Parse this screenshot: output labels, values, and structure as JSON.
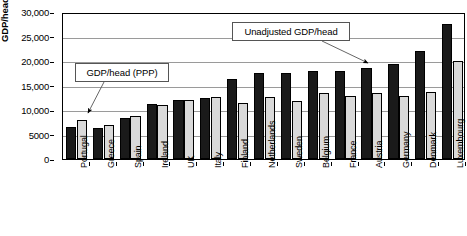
{
  "chart_data": {
    "type": "bar",
    "title": "",
    "xlabel": "",
    "ylabel": "GDP/head (£s)",
    "ylim": [
      0,
      30000
    ],
    "ytick_labels": [
      "30,000",
      "25,000",
      "20,000",
      "15,000",
      "10,000",
      "5000",
      "0"
    ],
    "ytick_values": [
      30000,
      25000,
      20000,
      15000,
      10000,
      5000,
      0
    ],
    "grid": true,
    "legend_position": "none",
    "categories": [
      "Portugal",
      "Greece",
      "Spain",
      "Ireland",
      "UK",
      "Italy",
      "Finland",
      "Netherlands",
      "Sweden",
      "Belgium",
      "France",
      "Austria",
      "Germany",
      "Denmark",
      "Luxembourg"
    ],
    "series": [
      {
        "name": "Unadjusted GDP/head",
        "color": "#1a1a1a",
        "values": [
          6500,
          6400,
          8300,
          11300,
          12000,
          12500,
          16300,
          17500,
          17600,
          17900,
          17900,
          18600,
          19300,
          22100,
          27600
        ]
      },
      {
        "name": "GDP/head (PPP)",
        "color": "#d9d9d9",
        "values": [
          8000,
          7000,
          8700,
          11000,
          12100,
          12700,
          11500,
          12700,
          11900,
          13400,
          12900,
          13400,
          12800,
          13700,
          20000
        ]
      }
    ],
    "annotations": [
      {
        "id": "ppp",
        "text": "GDP/head (PPP)",
        "points_to": "Portugal light bar"
      },
      {
        "id": "unadjusted",
        "text": "Unadjusted GDP/head",
        "points_to": "Germany dark bar"
      }
    ]
  }
}
